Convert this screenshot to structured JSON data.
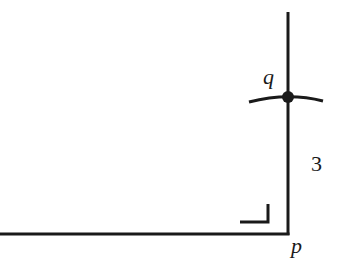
{
  "diagram": {
    "type": "geometric construction",
    "stroke_color": "#1a1a1a",
    "background": "#ffffff",
    "points": [
      {
        "id": "q",
        "label": "q",
        "x": 288,
        "y": 97,
        "marked_dot": true
      },
      {
        "id": "p",
        "label": "p",
        "x": 288,
        "y": 234,
        "marked_dot": false
      }
    ],
    "segments": [
      {
        "id": "vertical-line",
        "from": [
          288,
          12
        ],
        "to": [
          288,
          235
        ]
      },
      {
        "id": "horizontal-line",
        "from": [
          0,
          234
        ],
        "to": [
          288,
          234
        ]
      }
    ],
    "arcs": [
      {
        "id": "compass-arc",
        "through": "q",
        "from": [
          249,
          101
        ],
        "to": [
          323,
          101
        ]
      }
    ],
    "right_angle_marker": {
      "at": "p",
      "size": 18
    },
    "labels": {
      "q": "q",
      "p": "p",
      "length": "3"
    }
  }
}
